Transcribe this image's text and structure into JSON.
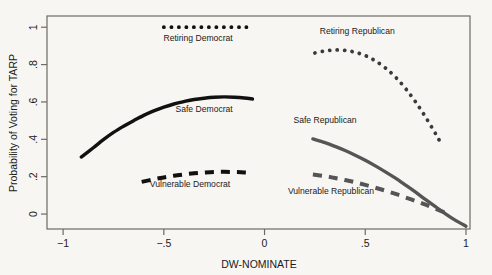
{
  "chart_data": {
    "type": "line",
    "title": "",
    "xlabel": "DW-NOMINATE",
    "ylabel": "Probability of Voting for TARP",
    "xlim": [
      -1.08,
      1.02
    ],
    "ylim": [
      -0.08,
      1.06
    ],
    "xticks": [
      -1,
      -0.5,
      0,
      0.5,
      1
    ],
    "xticklabels": [
      "−1",
      "−.5",
      "0",
      ".5",
      "1"
    ],
    "yticks": [
      0,
      0.2,
      0.4,
      0.6,
      0.8,
      1
    ],
    "yticklabels": [
      "0",
      ".2",
      ".4",
      ".6",
      ".8",
      "1"
    ],
    "grid": false,
    "legend": "inline-labels",
    "series": [
      {
        "name": "Retiring Democrat",
        "style": "dotted",
        "color": "#111111",
        "label_x": -0.33,
        "label_y": 0.925,
        "points": [
          {
            "x": -0.5,
            "y": 1.0
          },
          {
            "x": -0.45,
            "y": 1.0
          },
          {
            "x": -0.4,
            "y": 1.0
          },
          {
            "x": -0.35,
            "y": 1.0
          },
          {
            "x": -0.3,
            "y": 1.0
          },
          {
            "x": -0.25,
            "y": 1.0
          },
          {
            "x": -0.2,
            "y": 1.0
          },
          {
            "x": -0.15,
            "y": 1.0
          },
          {
            "x": -0.1,
            "y": 1.0
          },
          {
            "x": -0.06,
            "y": 1.0
          }
        ]
      },
      {
        "name": "Safe Democrat",
        "style": "solid",
        "color": "#111111",
        "label_x": -0.3,
        "label_y": 0.545,
        "points": [
          {
            "x": -0.91,
            "y": 0.305
          },
          {
            "x": -0.85,
            "y": 0.355
          },
          {
            "x": -0.8,
            "y": 0.398
          },
          {
            "x": -0.75,
            "y": 0.437
          },
          {
            "x": -0.7,
            "y": 0.47
          },
          {
            "x": -0.65,
            "y": 0.5
          },
          {
            "x": -0.6,
            "y": 0.528
          },
          {
            "x": -0.55,
            "y": 0.552
          },
          {
            "x": -0.5,
            "y": 0.572
          },
          {
            "x": -0.45,
            "y": 0.589
          },
          {
            "x": -0.4,
            "y": 0.602
          },
          {
            "x": -0.35,
            "y": 0.613
          },
          {
            "x": -0.3,
            "y": 0.62
          },
          {
            "x": -0.25,
            "y": 0.625
          },
          {
            "x": -0.2,
            "y": 0.627
          },
          {
            "x": -0.15,
            "y": 0.625
          },
          {
            "x": -0.1,
            "y": 0.621
          },
          {
            "x": -0.06,
            "y": 0.616
          }
        ]
      },
      {
        "name": "Vulnerable Democrat",
        "style": "dashed",
        "color": "#111111",
        "label_x": -0.37,
        "label_y": 0.145,
        "points": [
          {
            "x": -0.61,
            "y": 0.172
          },
          {
            "x": -0.55,
            "y": 0.186
          },
          {
            "x": -0.5,
            "y": 0.196
          },
          {
            "x": -0.45,
            "y": 0.205
          },
          {
            "x": -0.4,
            "y": 0.212
          },
          {
            "x": -0.35,
            "y": 0.218
          },
          {
            "x": -0.3,
            "y": 0.222
          },
          {
            "x": -0.25,
            "y": 0.225
          },
          {
            "x": -0.2,
            "y": 0.226
          },
          {
            "x": -0.15,
            "y": 0.225
          },
          {
            "x": -0.1,
            "y": 0.223
          },
          {
            "x": -0.06,
            "y": 0.22
          }
        ]
      },
      {
        "name": "Retiring Republican",
        "style": "dotted",
        "color": "#3a3a3a",
        "label_x": 0.46,
        "label_y": 0.965,
        "points": [
          {
            "x": 0.25,
            "y": 0.862
          },
          {
            "x": 0.3,
            "y": 0.873
          },
          {
            "x": 0.35,
            "y": 0.878
          },
          {
            "x": 0.4,
            "y": 0.876
          },
          {
            "x": 0.45,
            "y": 0.866
          },
          {
            "x": 0.5,
            "y": 0.848
          },
          {
            "x": 0.55,
            "y": 0.82
          },
          {
            "x": 0.6,
            "y": 0.782
          },
          {
            "x": 0.65,
            "y": 0.733
          },
          {
            "x": 0.7,
            "y": 0.672
          },
          {
            "x": 0.75,
            "y": 0.6
          },
          {
            "x": 0.8,
            "y": 0.518
          },
          {
            "x": 0.85,
            "y": 0.428
          },
          {
            "x": 0.88,
            "y": 0.37
          }
        ]
      },
      {
        "name": "Safe Republican",
        "style": "solid",
        "color": "#555555",
        "label_x": 0.3,
        "label_y": 0.485,
        "points": [
          {
            "x": 0.24,
            "y": 0.402
          },
          {
            "x": 0.3,
            "y": 0.382
          },
          {
            "x": 0.35,
            "y": 0.362
          },
          {
            "x": 0.4,
            "y": 0.34
          },
          {
            "x": 0.45,
            "y": 0.315
          },
          {
            "x": 0.5,
            "y": 0.288
          },
          {
            "x": 0.55,
            "y": 0.258
          },
          {
            "x": 0.6,
            "y": 0.226
          },
          {
            "x": 0.65,
            "y": 0.192
          },
          {
            "x": 0.7,
            "y": 0.155
          },
          {
            "x": 0.75,
            "y": 0.117
          },
          {
            "x": 0.8,
            "y": 0.077
          },
          {
            "x": 0.85,
            "y": 0.038
          },
          {
            "x": 0.9,
            "y": 0.0
          },
          {
            "x": 0.95,
            "y": -0.035
          },
          {
            "x": 1.0,
            "y": -0.065
          }
        ]
      },
      {
        "name": "Vulnerable Republican",
        "style": "dashed",
        "color": "#555555",
        "label_x": 0.33,
        "label_y": 0.105,
        "points": [
          {
            "x": 0.24,
            "y": 0.212
          },
          {
            "x": 0.3,
            "y": 0.203
          },
          {
            "x": 0.35,
            "y": 0.193
          },
          {
            "x": 0.4,
            "y": 0.182
          },
          {
            "x": 0.45,
            "y": 0.17
          },
          {
            "x": 0.5,
            "y": 0.156
          },
          {
            "x": 0.55,
            "y": 0.141
          },
          {
            "x": 0.6,
            "y": 0.125
          },
          {
            "x": 0.65,
            "y": 0.108
          },
          {
            "x": 0.7,
            "y": 0.089
          },
          {
            "x": 0.75,
            "y": 0.07
          },
          {
            "x": 0.8,
            "y": 0.05
          },
          {
            "x": 0.85,
            "y": 0.028
          },
          {
            "x": 0.91,
            "y": 0.002
          }
        ]
      }
    ]
  }
}
